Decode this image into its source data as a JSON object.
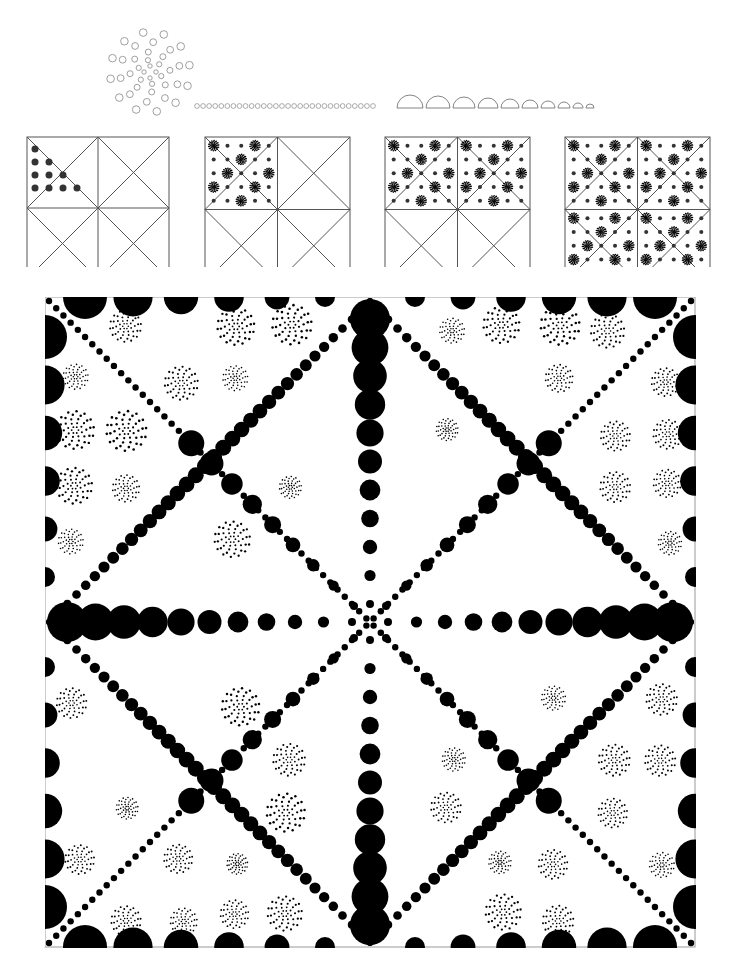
{
  "canvas": {
    "width": 741,
    "height": 971,
    "background": "#ffffff",
    "ink": "#000000",
    "outline": "#555555"
  },
  "legend": {
    "rosette": {
      "cx": 150,
      "cy": 72,
      "rings": [
        [
          6,
          4,
          2.2
        ],
        [
          12,
          6,
          2.6
        ],
        [
          20,
          8,
          3.0
        ],
        [
          30,
          10,
          3.4
        ],
        [
          40,
          12,
          3.8
        ]
      ]
    },
    "small_circles_row": {
      "x0": 197,
      "x1": 373,
      "y": 106,
      "count": 30,
      "r": 2.4
    },
    "half_circles_row": {
      "y": 108,
      "x0": 397,
      "radii": [
        13,
        12,
        11,
        10,
        9,
        8,
        7,
        6,
        5,
        4
      ],
      "gap": 3
    }
  },
  "steps": [
    {
      "x": 27,
      "y": 137,
      "size": 142,
      "filled": "tri1"
    },
    {
      "x": 205,
      "y": 137,
      "size": 145,
      "filled": "quad1"
    },
    {
      "x": 385,
      "y": 137,
      "size": 145,
      "filled": "half"
    },
    {
      "x": 565,
      "y": 137,
      "size": 145,
      "filled": "all"
    }
  ],
  "main": {
    "x": 45,
    "y": 297,
    "size": 650
  }
}
